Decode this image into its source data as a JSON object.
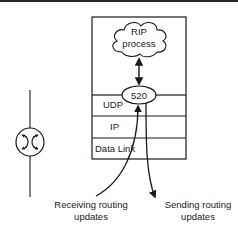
{
  "diagram": {
    "cloud": {
      "line1": "RIP",
      "line2": "process"
    },
    "port": {
      "label": "520"
    },
    "layers": [
      {
        "label": "UDP"
      },
      {
        "label": "IP"
      },
      {
        "label": "Data Link"
      }
    ],
    "router_icon": "router-icon",
    "annotations": {
      "receiving": {
        "line1": "Receiving routing",
        "line2": "updates"
      },
      "sending": {
        "line1": "Sending routing",
        "line2": "updates"
      }
    },
    "colors": {
      "stroke": "#1a1a1a",
      "background": "#ffffff"
    }
  }
}
